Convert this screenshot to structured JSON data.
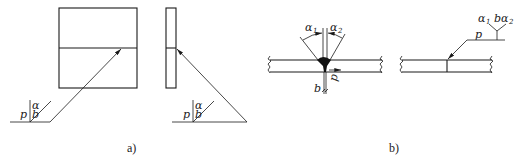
{
  "figure_a": {
    "caption": "a)",
    "front_view": {
      "symbols": {
        "alpha": "α",
        "b": "b",
        "p": "p"
      }
    },
    "side_view": {
      "symbols": {
        "alpha": "α",
        "b": "b",
        "p": "p"
      }
    }
  },
  "figure_b": {
    "caption": "b)",
    "section": {
      "labels": {
        "alpha1": "α",
        "alpha1_sub": "1",
        "alpha2": "α",
        "alpha2_sub": "2",
        "b": "b",
        "p": "p"
      }
    },
    "drawing": {
      "labels": {
        "alpha1": "α",
        "alpha1_sub": "1",
        "b": "b",
        "alpha2": "α",
        "alpha2_sub": "2",
        "p": "p"
      }
    }
  },
  "colors": {
    "line": "#1a1a1a",
    "background": "#ffffff"
  }
}
